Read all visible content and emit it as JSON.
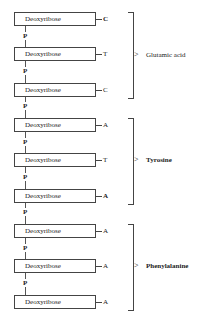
{
  "diagram": {
    "nucleotides": [
      {
        "sugar": "Deoxyribose",
        "base": "C",
        "phosphate": "P"
      },
      {
        "sugar": "Deoxyribose",
        "base": "T",
        "phosphate": "P"
      },
      {
        "sugar": "Deoxyribose",
        "base": "C",
        "phosphate": "P"
      },
      {
        "sugar": "Deoxyribose",
        "base": "A",
        "phosphate": "P"
      },
      {
        "sugar": "Deoxyribose",
        "base": "T",
        "phosphate": "P"
      },
      {
        "sugar": "Deoxyribose",
        "base": "A",
        "phosphate": "P"
      },
      {
        "sugar": "Deoxyribose",
        "base": "A",
        "phosphate": "P"
      },
      {
        "sugar": "Deoxyribose",
        "base": "A",
        "phosphate": "P"
      },
      {
        "sugar": "Deoxyribose",
        "base": "A",
        "phosphate": ""
      }
    ],
    "codons": [
      {
        "amino_acid": "Glutamic acid"
      },
      {
        "amino_acid": "Tyrosine"
      },
      {
        "amino_acid": "Phenylalanine"
      }
    ]
  }
}
